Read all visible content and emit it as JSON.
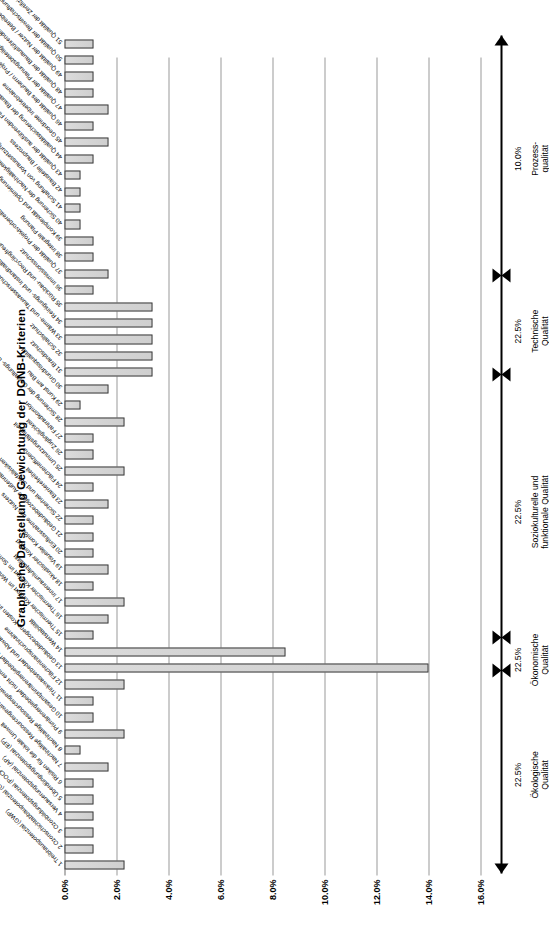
{
  "chart_data": {
    "type": "bar",
    "title": "Graphische Darstellung Gewichtung der DGNB-Kriterien",
    "orientation": "horizontal",
    "xlabel": "",
    "ylabel": "",
    "ylim": [
      0.0,
      16.0
    ],
    "yticks": [
      "0.0%",
      "2.0%",
      "4.0%",
      "6.0%",
      "8.0%",
      "10.0%",
      "12.0%",
      "14.0%",
      "16.0%"
    ],
    "ytick_values": [
      0.0,
      2.0,
      4.0,
      6.0,
      8.0,
      10.0,
      12.0,
      14.0,
      16.0
    ],
    "grid": true,
    "legend": false,
    "value_unit": "%",
    "categories": [
      "1 Treibhauspotenzial (GWP)",
      "2 Ozonschichtabbaupotenzial (ODP)",
      "3 Ozonbildungspotenzial (POCP)",
      "4 Versauerungspotenzial (AP)",
      "5 Überdüngungspotenzial (EP)",
      "6 Risiken für die lokale Umwelt",
      "7 Nachhaltige Ressourcengewinnung",
      "8 Nachhaltige Ressourcengewinnung / Holz",
      "9 Primärenergiebedarf nicht erneuerbar (PEne)",
      "10 Gesamtprimärenergiebedarf und Anteil erneuerbare Primärenergie",
      "11 Trinkwasserbedarf und Abwasseraufkommen",
      "12 Flächeninanspruchnahme",
      "13 Gebäudebezogene Kosten im Lebenszyklus",
      "14 Wertstabilität",
      "15 Thermischer Komfort im Winter",
      "16 Thermischer Komfort im Sommer",
      "17 Innenraumluftqualität",
      "18 Akustischer Komfort",
      "19 Visueller Komfort",
      "20 Einflussnahme des Nutzers",
      "21 Gebäudebezogene Außenraumqualität",
      "22 Sicherheit und Störfallrisiken",
      "23 Barrierefreiheit",
      "24 Flächeneffizienz",
      "25 Umnutzungsfähigkeit",
      "26 Zugänglichkeit",
      "27 Fahrradkomfort",
      "28 Sicherung der Gestaltungs- und Baukultur",
      "29 Kunst am Bau",
      "30 Grundrissqualität",
      "31 Brandschutz",
      "32 Schallschutz",
      "33 Wärme- und Tauwasserschutz",
      "34 Reinigungs- und Instandhaltungsfreundlichkeit",
      "35 Rückbau- und Recyclingfreundlichkeit",
      "36 Immissionsschutz",
      "37 Qualität der Projektvorbereitung",
      "38 Integrale Planung",
      "39 Komplexität und Optimierung der Planung",
      "40 Sicherung der Nachhaltigkeitsaspekte in Ausschreibung und Vergabe",
      "41 Schaffung von Voraussetzungen für eine optimale Nutzung und Bewirtschaftung",
      "42 Baustelle / Bauprozess",
      "43 Qualität der ausführenden Firmen / Präqualifikation",
      "44 Qualitätssicherung der Bauausführung",
      "45 Geordnete Inbetriebnahme",
      "46 Qualität des Bauherrn / Projektentwicklers",
      "47 Qualität der Planungsbeteiligten",
      "48 Qualität der Bauausführenden",
      "49 Qualität der Nutzer / Betreiber",
      "50 Qualität der Bewirtschaftung und Nutzung",
      "51 Qualität der Zertifizierung"
    ],
    "values": [
      2.3,
      1.1,
      1.1,
      1.1,
      1.1,
      1.1,
      1.7,
      0.6,
      2.3,
      1.1,
      1.1,
      2.3,
      14.0,
      8.5,
      1.1,
      1.7,
      2.3,
      1.1,
      1.7,
      1.1,
      1.1,
      1.1,
      1.7,
      1.1,
      2.3,
      1.1,
      1.1,
      2.3,
      0.6,
      1.7,
      3.4,
      3.4,
      3.4,
      3.4,
      3.4,
      1.1,
      1.7,
      1.1,
      1.1,
      0.6,
      0.6,
      0.6,
      0.6,
      1.1,
      1.7,
      1.1,
      1.7,
      1.1,
      1.1,
      1.1,
      1.1
    ],
    "groups": [
      {
        "name": "Ökologische\nQualität",
        "weight": "22.5%",
        "first": 1,
        "last": 12
      },
      {
        "name": "Ökonomische\nQualität",
        "weight": "22.5%",
        "first": 13,
        "last": 14
      },
      {
        "name": "Soziokulturelle und\nfunktionale Qualität",
        "weight": "22.5%",
        "first": 15,
        "last": 30
      },
      {
        "name": "Technische\nQualität",
        "weight": "22.5%",
        "first": 31,
        "last": 36
      },
      {
        "name": "Prozess-\nqualität",
        "weight": "10.0%",
        "first": 37,
        "last": 51
      }
    ],
    "colors": {
      "bar_fill": "#d4d4d4",
      "bar_stroke": "#3a3a3a",
      "grid": "#9a9a9a",
      "axis": "#000000",
      "text": "#000000"
    }
  }
}
